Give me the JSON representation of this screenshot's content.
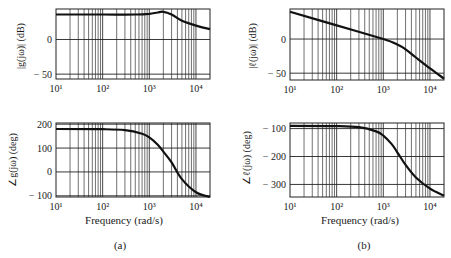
{
  "chart_data": [
    {
      "id": "a-magnitude",
      "panel": "(a)",
      "type": "line",
      "title": "",
      "xlabel": "",
      "ylabel": "|g(jω)| (dB)",
      "xscale": "log",
      "xlim": [
        10,
        20000
      ],
      "ylim": [
        -57,
        44
      ],
      "xticks": [
        10,
        100,
        1000,
        10000
      ],
      "xtick_labels": [
        "10¹",
        "10²",
        "10³",
        "10⁴"
      ],
      "yticks": [
        0,
        -50
      ],
      "ytick_labels": [
        "0",
        "− 50"
      ],
      "grid": true,
      "x": [
        10,
        100,
        500,
        1000,
        1500,
        2000,
        3000,
        5000,
        10000,
        20000
      ],
      "values": [
        36,
        36,
        36,
        37,
        39,
        40,
        36,
        27,
        20,
        15
      ]
    },
    {
      "id": "a-phase",
      "panel": "(a)",
      "type": "line",
      "title": "",
      "xlabel": "Frequency (rad/s)",
      "ylabel": "∠g(jω) (deg)",
      "xscale": "log",
      "xlim": [
        10,
        20000
      ],
      "ylim": [
        -105,
        205
      ],
      "xticks": [
        10,
        100,
        1000,
        10000
      ],
      "xtick_labels": [
        "10¹",
        "10²",
        "10³",
        "10⁴"
      ],
      "yticks": [
        200,
        100,
        0,
        -100
      ],
      "ytick_labels": [
        "200",
        "100",
        "0",
        "− 100"
      ],
      "grid": true,
      "x": [
        10,
        100,
        300,
        700,
        1000,
        1500,
        2000,
        3000,
        5000,
        10000,
        20000
      ],
      "values": [
        180,
        179,
        175,
        160,
        145,
        115,
        85,
        40,
        -30,
        -85,
        -105
      ]
    },
    {
      "id": "b-magnitude",
      "panel": "(b)",
      "type": "line",
      "title": "",
      "xlabel": "",
      "ylabel": "|ℓ(jω)| (dB)",
      "xscale": "log",
      "xlim": [
        10,
        20000
      ],
      "ylim": [
        -60,
        44
      ],
      "xticks": [
        10,
        100,
        1000,
        10000
      ],
      "xtick_labels": [
        "10¹",
        "10²",
        "10³",
        "10⁴"
      ],
      "yticks": [
        0,
        -50
      ],
      "ytick_labels": [
        "0",
        "− 50"
      ],
      "grid": true,
      "x": [
        10,
        100,
        1000,
        2000,
        3000,
        5000,
        10000,
        20000
      ],
      "values": [
        40,
        20,
        0,
        -8,
        -15,
        -27,
        -43,
        -58
      ]
    },
    {
      "id": "b-phase",
      "panel": "(b)",
      "type": "line",
      "title": "",
      "xlabel": "Frequency (rad/s)",
      "ylabel": "∠ℓ(jω) (deg)",
      "xscale": "log",
      "xlim": [
        10,
        20000
      ],
      "ylim": [
        -345,
        -80
      ],
      "xticks": [
        10,
        100,
        1000,
        10000
      ],
      "xtick_labels": [
        "10¹",
        "10²",
        "10³",
        "10⁴"
      ],
      "yticks": [
        -100,
        -200,
        -300
      ],
      "ytick_labels": [
        "− 100",
        "− 200",
        "− 300"
      ],
      "grid": true,
      "x": [
        10,
        100,
        300,
        700,
        1000,
        1500,
        2000,
        3000,
        5000,
        10000,
        20000
      ],
      "values": [
        -90,
        -91,
        -95,
        -110,
        -125,
        -155,
        -185,
        -230,
        -275,
        -315,
        -340
      ]
    }
  ],
  "captions": {
    "a": "(a)",
    "b": "(b)"
  },
  "labels": {
    "a_mag_ylabel": "|g(jω)| (dB)",
    "a_phase_ylabel": "∠g(jω) (deg)",
    "b_mag_ylabel": "|ℓ(jω)| (dB)",
    "b_phase_ylabel": "∠ℓ(jω) (deg)",
    "xlabel": "Frequency (rad/s)"
  }
}
